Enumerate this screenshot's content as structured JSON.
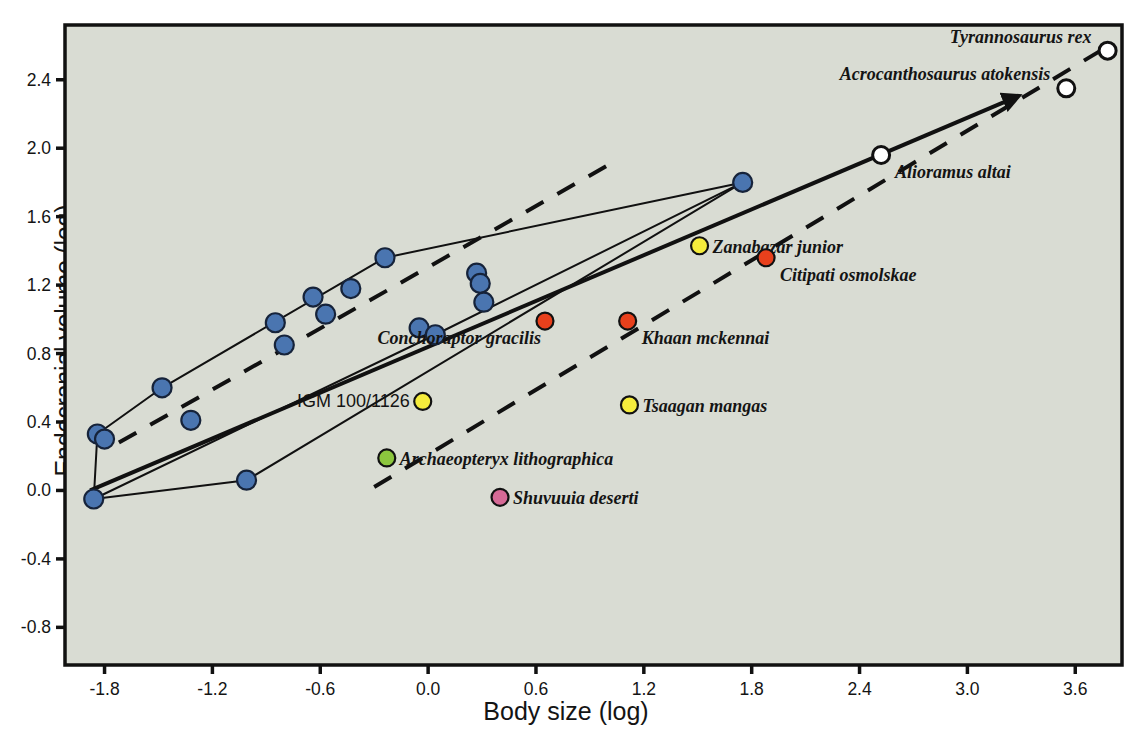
{
  "chart_data": {
    "type": "scatter",
    "title": "",
    "xlabel": "Body size (log)",
    "ylabel": "Endocranial volume (log)",
    "xlim": [
      -2.02,
      3.86
    ],
    "ylim": [
      -1.02,
      2.72
    ],
    "grid": false,
    "legend": "none",
    "plot_background": "#d9dcd3",
    "xticks": [
      "-1.8",
      "-1.2",
      "-0.6",
      "0.0",
      "0.6",
      "1.2",
      "1.8",
      "2.4",
      "3.0",
      "3.6"
    ],
    "xtick_values": [
      -1.8,
      -1.2,
      -0.6,
      0.0,
      0.6,
      1.2,
      1.8,
      2.4,
      3.0,
      3.6
    ],
    "yticks": [
      "2.4",
      "2.0",
      "1.6",
      "1.2",
      "0.8",
      "0.4",
      "0.0",
      "-0.4",
      "-0.8"
    ],
    "ytick_values": [
      2.4,
      2.0,
      1.6,
      1.2,
      0.8,
      0.4,
      0.0,
      -0.4,
      -0.8
    ],
    "series": [
      {
        "name": "non-avian unlabeled taxa",
        "marker": "filled-circle",
        "color": "#4a75b0",
        "edge_color": "#16233a",
        "points": [
          {
            "x": -1.86,
            "y": -0.05
          },
          {
            "x": -1.84,
            "y": 0.33
          },
          {
            "x": -1.8,
            "y": 0.3
          },
          {
            "x": -1.48,
            "y": 0.6
          },
          {
            "x": -1.32,
            "y": 0.41
          },
          {
            "x": -1.01,
            "y": 0.06
          },
          {
            "x": -0.85,
            "y": 0.98
          },
          {
            "x": -0.8,
            "y": 0.85
          },
          {
            "x": -0.64,
            "y": 1.13
          },
          {
            "x": -0.57,
            "y": 1.03
          },
          {
            "x": -0.43,
            "y": 1.18
          },
          {
            "x": -0.24,
            "y": 1.36
          },
          {
            "x": -0.05,
            "y": 0.95
          },
          {
            "x": 0.04,
            "y": 0.91
          },
          {
            "x": 0.27,
            "y": 1.27
          },
          {
            "x": 0.29,
            "y": 1.21
          },
          {
            "x": 0.31,
            "y": 1.1
          },
          {
            "x": 1.75,
            "y": 1.8
          }
        ]
      },
      {
        "name": "labeled taxa",
        "marker": "filled-circle",
        "points": [
          {
            "x": -0.03,
            "y": 0.52,
            "label": "IGM 100/1126",
            "color": "#f5ec3c",
            "label_side": "left",
            "italic": false
          },
          {
            "x": -0.23,
            "y": 0.19,
            "label": "Archaeopteryx lithographica",
            "color": "#8cc63e",
            "label_side": "right",
            "italic": true
          },
          {
            "x": 0.65,
            "y": 0.99,
            "label": "Conchoraptor gracilis",
            "color": "#e8401c",
            "label_side": "left-below",
            "italic": true
          },
          {
            "x": 1.11,
            "y": 0.99,
            "label": "Khaan mckennai",
            "color": "#e8401c",
            "label_side": "right-below",
            "italic": true
          },
          {
            "x": 1.12,
            "y": 0.5,
            "label": "Tsaagan mangas",
            "color": "#f5ec3c",
            "label_side": "right",
            "italic": true
          },
          {
            "x": 0.4,
            "y": -0.04,
            "label": "Shuvuuia deserti",
            "color": "#d66a96",
            "label_side": "right",
            "italic": true
          },
          {
            "x": 1.51,
            "y": 1.43,
            "label": "Zanabazar junior",
            "color": "#f5ec3c",
            "label_side": "right",
            "italic": true
          },
          {
            "x": 1.88,
            "y": 1.36,
            "label": "Citipati osmolskae",
            "color": "#e8401c",
            "label_side": "right-below",
            "italic": true
          }
        ]
      },
      {
        "name": "tyrannosauroids",
        "marker": "open-circle",
        "color": "#ffffff",
        "edge_color": "#111111",
        "points": [
          {
            "x": 2.52,
            "y": 1.96,
            "label": "Alioramus altai",
            "label_side": "right-below",
            "italic": true
          },
          {
            "x": 3.55,
            "y": 2.35,
            "label": "Acrocanthosaurus atokensis",
            "label_side": "left-above",
            "italic": true
          },
          {
            "x": 3.78,
            "y": 2.57,
            "label": "Tyrannosaurus rex",
            "label_side": "left-above",
            "italic": true
          }
        ]
      }
    ],
    "lines": [
      {
        "name": "major-axis-regression",
        "style": "solid",
        "width": 4,
        "arrow": true,
        "from": {
          "x": -1.88,
          "y": 0.0
        },
        "to": {
          "x": 3.25,
          "y": 2.29
        }
      },
      {
        "name": "upper-dashed-trend",
        "style": "dashed",
        "width": 4,
        "from": {
          "x": -1.72,
          "y": 0.28
        },
        "to": {
          "x": 1.05,
          "y": 1.93
        }
      },
      {
        "name": "lower-dashed-trend",
        "style": "dashed",
        "width": 4,
        "from": {
          "x": -0.3,
          "y": 0.02
        },
        "to": {
          "x": 3.82,
          "y": 2.62
        }
      },
      {
        "name": "convex-hull-polygon",
        "style": "solid",
        "width": 2,
        "vertices": [
          {
            "x": -1.86,
            "y": -0.05
          },
          {
            "x": -1.84,
            "y": 0.33
          },
          {
            "x": -1.48,
            "y": 0.6
          },
          {
            "x": -0.24,
            "y": 1.36
          },
          {
            "x": 1.75,
            "y": 1.8
          },
          {
            "x": 0.04,
            "y": 0.91
          },
          {
            "x": -1.86,
            "y": -0.05
          }
        ]
      },
      {
        "name": "inner-hull-edge",
        "style": "solid",
        "width": 2,
        "vertices": [
          {
            "x": -1.86,
            "y": -0.05
          },
          {
            "x": -1.01,
            "y": 0.06
          },
          {
            "x": 1.75,
            "y": 1.8
          }
        ]
      }
    ]
  },
  "axis": {
    "x_title": "Body size (log)",
    "y_title": "Endocranial volume (log)"
  }
}
